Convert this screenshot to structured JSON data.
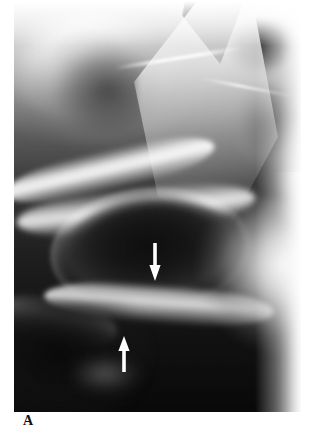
{
  "figure": {
    "label": "A",
    "modality": "radiograph",
    "view": "pelvis oblique",
    "background_color": "#ffffff",
    "plate_color": "#0a0a0a"
  },
  "annotations": {
    "color": "#ffffff",
    "arrows": [
      {
        "name": "arrow-upper",
        "direction": "down",
        "x": 141,
        "y": 260,
        "length": 36
      },
      {
        "name": "arrow-lower",
        "direction": "up",
        "x": 110,
        "y": 352,
        "length": 34
      }
    ]
  },
  "anatomy": {
    "regions": [
      {
        "name": "iliac-wing",
        "tone": "bright"
      },
      {
        "name": "sacral-wedge",
        "tone": "bright"
      },
      {
        "name": "superior-pubic-ramus",
        "tone": "bright"
      },
      {
        "name": "acetabular-roof",
        "tone": "bright"
      },
      {
        "name": "obturator-foramen",
        "tone": "dark"
      },
      {
        "name": "inferior-pubic-ramus",
        "tone": "bright"
      },
      {
        "name": "femoral-head",
        "tone": "bright"
      },
      {
        "name": "bowel-gas-shadow",
        "tone": "dark"
      },
      {
        "name": "ischial-tuberosity",
        "tone": "mid"
      }
    ]
  }
}
